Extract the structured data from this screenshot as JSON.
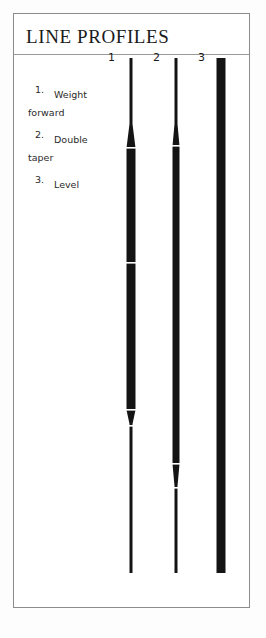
{
  "panel": {
    "title": "LINE PROFILES",
    "background_color": "#ffffff",
    "border_color": "#8c8c8c",
    "ink_color": "#141414"
  },
  "legend": {
    "items": [
      {
        "number": "1.",
        "label": "Weight\nforward"
      },
      {
        "number": "2.",
        "label": "Double\ntaper"
      },
      {
        "number": "3.",
        "label": "Level"
      }
    ]
  },
  "diagram": {
    "columns": [
      {
        "label": "1",
        "name": "weight-forward-profile",
        "description": "Weight forward fly line: fine level tip, short front taper into a heavy belly, abrupt back taper into a long thin running line.",
        "segments": [
          {
            "part": "tip",
            "y_start": 0,
            "y_end": 66,
            "width": 3
          },
          {
            "part": "front-taper",
            "y_start": 66,
            "y_end": 90,
            "width_start": 3,
            "width_end": 13
          },
          {
            "part": "belly",
            "y_start": 90,
            "y_end": 352,
            "width": 13
          },
          {
            "part": "back-taper",
            "y_start": 352,
            "y_end": 366,
            "width_start": 13,
            "width_end": 3
          },
          {
            "part": "running-line",
            "y_start": 366,
            "y_end": 515,
            "width": 3
          }
        ],
        "nicks_y": [
          90,
          205,
          352,
          368
        ]
      },
      {
        "label": "2",
        "name": "double-taper-profile",
        "description": "Double taper fly line: fine level tip, front taper into a long uniform belly, symmetric rear taper into a fine level tip.",
        "segments": [
          {
            "part": "tip",
            "y_start": 0,
            "y_end": 66,
            "width": 3
          },
          {
            "part": "front-taper",
            "y_start": 66,
            "y_end": 88,
            "width_start": 3,
            "width_end": 11
          },
          {
            "part": "belly",
            "y_start": 88,
            "y_end": 406,
            "width": 11
          },
          {
            "part": "rear-taper",
            "y_start": 406,
            "y_end": 428,
            "width_start": 11,
            "width_end": 3
          },
          {
            "part": "tail-tip",
            "y_start": 428,
            "y_end": 515,
            "width": 3
          }
        ],
        "nicks_y": [
          88,
          406,
          430
        ]
      },
      {
        "label": "3",
        "name": "level-profile",
        "description": "Level fly line: constant diameter from end to end, no taper.",
        "segments": [
          {
            "part": "level",
            "y_start": 0,
            "y_end": 515,
            "width": 9
          }
        ],
        "nicks_y": []
      }
    ]
  }
}
